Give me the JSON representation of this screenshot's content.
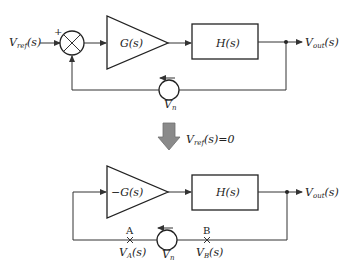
{
  "top_diagram": {
    "input_label": "V",
    "input_sub": "ref",
    "input_arg": "(s)",
    "summer_sign": "+",
    "amp_label": "G(s)",
    "block_label": "H(s)",
    "output_label": "V",
    "output_sub": "out",
    "output_arg": "(s)",
    "source_label": "V",
    "source_sub": "n"
  },
  "transition": {
    "condition_label": "V",
    "condition_sub": "ref",
    "condition_arg": "(s)=0",
    "arrow_color": "#8a8a8a"
  },
  "bottom_diagram": {
    "amp_label": "−G(s)",
    "block_label": "H(s)",
    "output_label": "V",
    "output_sub": "out",
    "output_arg": "(s)",
    "source_label": "V",
    "source_sub": "n",
    "point_a_label": "A",
    "point_a_value": "V",
    "point_a_sub": "A",
    "point_a_arg": "(s)",
    "point_b_label": "B",
    "point_b_value": "V",
    "point_b_sub": "B",
    "point_b_arg": "(s)"
  }
}
